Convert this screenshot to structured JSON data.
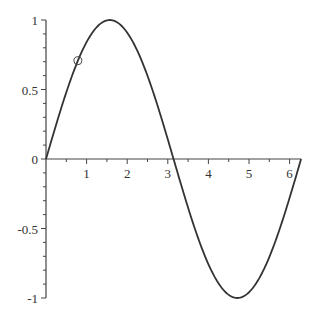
{
  "chart_data": {
    "type": "line",
    "title": "",
    "xlabel": "",
    "ylabel": "",
    "function": "sin(x)",
    "xlim": [
      0,
      6.2832
    ],
    "ylim": [
      -1,
      1
    ],
    "grid": false,
    "legend": null,
    "x_ticks": [
      "1",
      "2",
      "3",
      "4",
      "5",
      "6"
    ],
    "y_ticks": [
      "1",
      "0.5",
      "0",
      "-0.5",
      "-1"
    ],
    "series": [
      {
        "name": "sin(x)",
        "x": [
          0,
          0.5,
          1,
          1.5708,
          2,
          2.5,
          3,
          3.1416,
          3.5,
          4,
          4.7124,
          5,
          5.5,
          6,
          6.2832
        ],
        "values": [
          0,
          0.479,
          0.841,
          1,
          0.909,
          0.598,
          0.141,
          0,
          -0.351,
          -0.757,
          -1,
          -0.959,
          -0.706,
          -0.279,
          0
        ]
      }
    ],
    "annotations": [
      {
        "type": "circle-marker",
        "x": 0.785,
        "y": 0.707
      }
    ]
  }
}
